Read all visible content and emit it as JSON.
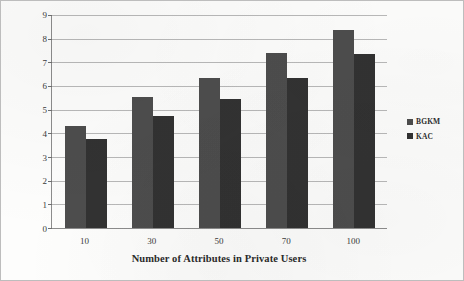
{
  "chart_data": {
    "type": "bar",
    "title": "",
    "xlabel": "Number of Attributes in Private Users",
    "ylabel": "Time for Setup environment in secs",
    "categories": [
      "10",
      "30",
      "50",
      "70",
      "100"
    ],
    "series": [
      {
        "name": "BGKM",
        "color": "#4d4d4d",
        "values": [
          4.3,
          5.55,
          6.35,
          7.4,
          8.35
        ]
      },
      {
        "name": "KAC",
        "color": "#323232",
        "values": [
          3.75,
          4.75,
          5.45,
          6.35,
          7.35
        ]
      }
    ],
    "ylim": [
      0,
      9
    ],
    "yticks": [
      0,
      1,
      2,
      3,
      4,
      5,
      6,
      7,
      8,
      9
    ],
    "ytick_labels": [
      "0",
      "1",
      "2",
      "3",
      "4",
      "5",
      "6",
      "7",
      "8",
      "9"
    ],
    "grid": true,
    "grid_axis": "y",
    "legend_position": "right",
    "frame": true
  }
}
